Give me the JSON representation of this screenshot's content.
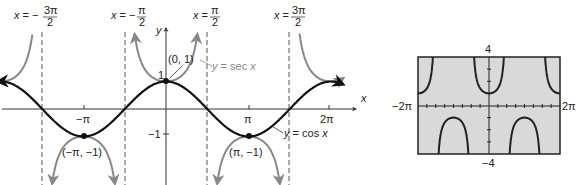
{
  "chart_data": [
    {
      "type": "line",
      "title": "",
      "xlabel": "x",
      "ylabel": "y",
      "series": [
        {
          "name": "y = cos x",
          "color": "#111111",
          "function": "cos",
          "domain": [
            -6.5,
            7.0
          ]
        },
        {
          "name": "y = sec x",
          "color": "#888888",
          "function": "sec",
          "domain": [
            -6.5,
            7.0
          ]
        }
      ],
      "asymptotes": [
        "x = -3π/2",
        "x = -π/2",
        "x = π/2",
        "x = 3π/2"
      ],
      "x_ticks": [
        "-π",
        "π",
        "2π"
      ],
      "y_ticks": [
        "1",
        "-1"
      ],
      "points": [
        {
          "label": "(0, 1)",
          "x": 0,
          "y": 1
        },
        {
          "label": "(-π, -1)",
          "x": -3.14159,
          "y": -1
        },
        {
          "label": "(π, -1)",
          "x": 3.14159,
          "y": -1
        }
      ],
      "grid": false
    },
    {
      "type": "line",
      "title": "Graphing calculator view of y = sec x",
      "xlim": [
        "-2π",
        "2π"
      ],
      "ylim": [
        -4,
        4
      ],
      "series": [
        {
          "name": "y = sec x",
          "function": "sec"
        }
      ],
      "x_range_labels": {
        "min": "-2π",
        "max": "2π"
      },
      "y_range_labels": {
        "min": "-4",
        "max": "4"
      },
      "background": "#d9d9d9"
    }
  ],
  "labels": {
    "asym1_prefix": "x = −",
    "asym1_num": "3π",
    "asym1_den": "2",
    "asym2_prefix": "x = −",
    "asym2_num": "π",
    "asym2_den": "2",
    "asym3_prefix": "x = ",
    "asym3_num": "π",
    "asym3_den": "2",
    "asym4_prefix": "x = ",
    "asym4_num": "3π",
    "asym4_den": "2",
    "y_axis": "y",
    "x_axis": "x",
    "tick_neg_pi": "−π",
    "tick_pi": "π",
    "tick_2pi": "2π",
    "tick_one": "1",
    "tick_neg_one": "−1",
    "pt_origin": "(0, 1)",
    "pt_neg_pi": "(−π, −1)",
    "pt_pi": "(π, −1)",
    "sec_label": "y = sec x",
    "cos_label": "y = cos x",
    "calc_ymax": "4",
    "calc_ymin": "−4",
    "calc_xmin": "−2π",
    "calc_xmax": "2π"
  }
}
